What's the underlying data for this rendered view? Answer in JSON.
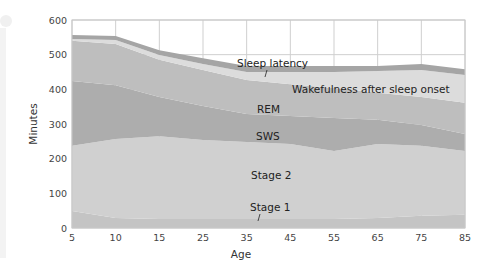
{
  "chart_data": {
    "type": "area",
    "stacked": true,
    "title": "",
    "xlabel": "Age",
    "ylabel": "Minutes",
    "ylim": [
      0,
      600
    ],
    "yticks": [
      0,
      100,
      200,
      300,
      400,
      500,
      600
    ],
    "categories": [
      "5",
      "10",
      "15",
      "25",
      "35",
      "45",
      "55",
      "65",
      "75",
      "85"
    ],
    "x": [
      5,
      10,
      15,
      25,
      35,
      45,
      55,
      65,
      75,
      85
    ],
    "grid": true,
    "legend": "inline labels",
    "series": [
      {
        "name": "Stage 1",
        "color": "#c4c4c4",
        "values": [
          49,
          29,
          26,
          26,
          26,
          26,
          26,
          29,
          35,
          38
        ]
      },
      {
        "name": "Stage 2",
        "color": "#d0d0d0",
        "values": [
          188,
          228,
          239,
          228,
          222,
          216,
          196,
          213,
          202,
          184
        ]
      },
      {
        "name": "SWS",
        "color": "#adadad",
        "values": [
          187,
          155,
          113,
          98,
          81,
          81,
          95,
          70,
          60,
          49
        ]
      },
      {
        "name": "REM",
        "color": "#bebebe",
        "values": [
          116,
          119,
          107,
          104,
          98,
          92,
          87,
          78,
          81,
          90
        ]
      },
      {
        "name": "Wakefulness after sleep onset",
        "color": "#dcdcdc",
        "values": [
          5,
          11,
          14,
          17,
          23,
          35,
          46,
          63,
          78,
          80
        ]
      },
      {
        "name": "Sleep latency",
        "color": "#a5a5a5",
        "values": [
          12,
          12,
          14,
          17,
          17,
          17,
          17,
          14,
          17,
          17
        ]
      }
    ],
    "annotations": [
      "Sleep latency",
      "Wakefulness after sleep onset",
      "REM",
      "SWS",
      "Stage 2",
      "Stage 1"
    ]
  },
  "labels": {
    "xlabel": "Age",
    "ylabel": "Minutes",
    "sleep_latency": "Sleep latency",
    "wakefulness": "Wakefulness after sleep onset",
    "rem": "REM",
    "sws": "SWS",
    "stage2": "Stage 2",
    "stage1": "Stage 1"
  },
  "yticks": [
    "0",
    "100",
    "200",
    "300",
    "400",
    "500",
    "600"
  ],
  "xticks": [
    "5",
    "10",
    "15",
    "25",
    "35",
    "45",
    "55",
    "65",
    "75",
    "85"
  ]
}
